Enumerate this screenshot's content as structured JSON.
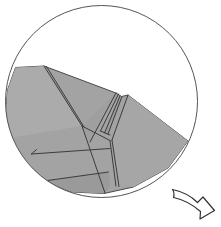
{
  "figure": {
    "kind": "origami-fold-diagram",
    "canvas": {
      "width": 221,
      "height": 227,
      "background": "#ffffff"
    },
    "colors": {
      "paper_fill": "#a3a3a3",
      "paper_fill_light": "#ababab",
      "paper_fill_dark": "#9a9a9a",
      "outline": "#4a4a4a",
      "fold_line": "#3c3c3c",
      "circle_stroke": "#555555",
      "arrow_stroke": "#333333",
      "background": "#ffffff"
    },
    "circle": {
      "name": "zoom-circle-boundary",
      "center_x": 101.5,
      "center_y": 101.5,
      "radius": 96,
      "stroke_width": 1,
      "filled": false
    },
    "paper": {
      "name": "folded-paper-model",
      "description": "Shaded folded paper form with two peaks occupying lower portion of the circle",
      "peaks": [
        {
          "label": "left-peak",
          "x": 116,
          "y": 93
        },
        {
          "label": "right-peak",
          "x": 128,
          "y": 95
        }
      ],
      "outline_points": [
        [
          15.5,
          67.5
        ],
        [
          44.0,
          66.0
        ],
        [
          116.0,
          93.0
        ],
        [
          121.5,
          96.5
        ],
        [
          128.0,
          95.0
        ],
        [
          188.0,
          141.0
        ],
        [
          168.0,
          168.0
        ],
        [
          133.5,
          187.0
        ],
        [
          104.0,
          193.5
        ],
        [
          72.0,
          192.0
        ],
        [
          44.0,
          181.0
        ],
        [
          22.0,
          162.0
        ],
        [
          9.5,
          138.0
        ],
        [
          5.8,
          112.0
        ],
        [
          7.5,
          90.0
        ]
      ],
      "fold_lines": [
        {
          "name": "fold-left-ridge",
          "points": [
            [
              44.0,
              66.0
            ],
            [
              82.0,
              126.0
            ]
          ]
        },
        {
          "name": "fold-left-ridge-inner",
          "points": [
            [
              46.5,
              66.5
            ],
            [
              84.0,
              127.0
            ]
          ]
        },
        {
          "name": "fold-peak-left-down",
          "points": [
            [
              116.0,
              93.0
            ],
            [
              90.0,
              142.0
            ]
          ]
        },
        {
          "name": "fold-peak-left-down-inner",
          "points": [
            [
              118.5,
              94.0
            ],
            [
              100.5,
              131.0
            ]
          ]
        },
        {
          "name": "fold-notch-sliver-left",
          "points": [
            [
              120.0,
              96.0
            ],
            [
              104.5,
              133.0
            ]
          ]
        },
        {
          "name": "fold-notch-sliver-right",
          "points": [
            [
              122.0,
              96.5
            ],
            [
              108.0,
              134.0
            ]
          ]
        },
        {
          "name": "fold-sliver-foot",
          "points": [
            [
              100.5,
              131.0
            ],
            [
              110.0,
              135.0
            ]
          ]
        },
        {
          "name": "fold-center-hub-to-right",
          "points": [
            [
              82.0,
              126.0
            ],
            [
              110.0,
              140.5
            ]
          ]
        },
        {
          "name": "fold-center-hub-down",
          "points": [
            [
              82.0,
              126.0
            ],
            [
              105.0,
              193.0
            ]
          ]
        },
        {
          "name": "fold-lower-left-horizontal",
          "points": [
            [
              31.5,
              154.0
            ],
            [
              110.0,
              148.5
            ]
          ]
        },
        {
          "name": "fold-lower-left-riser",
          "points": [
            [
              31.5,
              154.0
            ],
            [
              36.5,
              149.5
            ]
          ]
        },
        {
          "name": "fold-lower-band",
          "points": [
            [
              44.0,
              181.0
            ],
            [
              108.5,
              172.0
            ]
          ]
        },
        {
          "name": "fold-right-flap-edge",
          "points": [
            [
              110.0,
              140.5
            ],
            [
              116.0,
              186.0
            ]
          ]
        },
        {
          "name": "fold-right-sliver-edge",
          "points": [
            [
              112.0,
              140.0
            ],
            [
              119.0,
              186.5
            ]
          ]
        },
        {
          "name": "fold-right-peak-slope",
          "points": [
            [
              128.0,
              95.0
            ],
            [
              112.0,
              140.0
            ]
          ]
        }
      ],
      "facets": [
        {
          "name": "facet-upper-left-wing",
          "tone": "light"
        },
        {
          "name": "facet-left-lower",
          "tone": "base"
        },
        {
          "name": "facet-center-valley",
          "tone": "base"
        },
        {
          "name": "facet-right-wing",
          "tone": "base"
        },
        {
          "name": "facet-bottom-band",
          "tone": "dark"
        }
      ]
    },
    "arrow": {
      "name": "fold-direction-arrow",
      "description": "Curved swoosh arrow pointing down-right, indicating next folding action",
      "tail_x": 172,
      "tail_y": 190,
      "head_x": 219,
      "head_y": 212,
      "direction": "down-right",
      "style": "curved-outline"
    }
  }
}
